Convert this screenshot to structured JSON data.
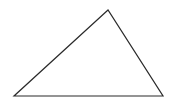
{
  "diagram": {
    "type": "triangle",
    "canvas": {
      "width": 175,
      "height": 103,
      "background": "#ffffff"
    },
    "stroke": {
      "color": "#2a2a2a",
      "width": 1.2
    },
    "fill": "none",
    "vertices": [
      {
        "name": "apex",
        "x": 108,
        "y": 10
      },
      {
        "name": "bottom-left",
        "x": 14,
        "y": 96
      },
      {
        "name": "bottom-right",
        "x": 163,
        "y": 96
      }
    ]
  }
}
